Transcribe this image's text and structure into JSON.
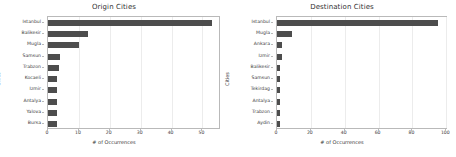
{
  "figure": {
    "width": 456,
    "height": 157,
    "bar_color": "#4d4d4d",
    "grid_color": "#ececec",
    "axis_color": "#b9b9b9"
  },
  "chart_data": [
    {
      "type": "bar",
      "orientation": "horizontal",
      "title": "Origin Cities",
      "xlabel": "# of Occurrences",
      "ylabel": "Cities",
      "categories": [
        "Istanbul",
        "Balikesir",
        "Mugla",
        "Samsun",
        "Trabzon",
        "Kocaeli",
        "Izmir",
        "Antalya",
        "Yalova",
        "Bursa"
      ],
      "values": [
        53,
        13,
        10,
        4,
        3.5,
        3,
        3,
        3,
        3,
        3
      ],
      "xticks": [
        0,
        10,
        20,
        30,
        40,
        50
      ],
      "xtick_labels": [
        "0",
        "10",
        "20",
        "30",
        "40",
        "50"
      ],
      "xlim": [
        0,
        56
      ],
      "grid": true,
      "legend": "none"
    },
    {
      "type": "bar",
      "orientation": "horizontal",
      "title": "Destination Cities",
      "xlabel": "# of Occurrences",
      "ylabel": "Cities",
      "categories": [
        "Istanbul",
        "Mugla",
        "Ankara",
        "Izmir",
        "Balikesir",
        "Samsun",
        "Tekirdag",
        "Antalya",
        "Trabzon",
        "Aydin"
      ],
      "values": [
        95,
        9,
        3,
        3,
        2,
        2,
        2,
        2,
        1.5,
        1.5
      ],
      "xticks": [
        0,
        20,
        40,
        60,
        80,
        100
      ],
      "xtick_labels": [
        "0",
        "20",
        "40",
        "60",
        "80",
        "100"
      ],
      "xlim": [
        0,
        101
      ],
      "grid": true,
      "legend": "none"
    }
  ]
}
